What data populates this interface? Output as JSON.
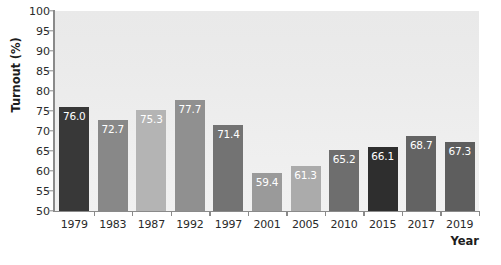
{
  "chart_data": {
    "type": "bar",
    "title": "",
    "xlabel": "Year",
    "ylabel": "Turnout (%)",
    "categories": [
      "1979",
      "1983",
      "1987",
      "1992",
      "1997",
      "2001",
      "2005",
      "2010",
      "2015",
      "2017",
      "2019"
    ],
    "values": [
      76.0,
      72.7,
      75.3,
      77.7,
      71.4,
      59.4,
      61.3,
      65.2,
      66.1,
      68.7,
      67.3
    ],
    "value_labels": [
      "76.0",
      "72.7",
      "75.3",
      "77.7",
      "71.4",
      "59.4",
      "61.3",
      "65.2",
      "66.1",
      "68.7",
      "67.3"
    ],
    "bar_colors": [
      "#383838",
      "#888888",
      "#b4b4b4",
      "#909090",
      "#737373",
      "#9a9a9a",
      "#ababab",
      "#6e6e6e",
      "#2e2e2e",
      "#636363",
      "#5e5e5e"
    ],
    "ylim": [
      50,
      100
    ],
    "yticks": [
      50,
      55,
      60,
      65,
      70,
      75,
      80,
      85,
      90,
      95,
      100
    ],
    "ytick_labels": [
      "50",
      "55",
      "60",
      "65",
      "70",
      "75",
      "80",
      "85",
      "90",
      "95",
      "100"
    ],
    "grid": false,
    "legend": null,
    "plot_background": "#ededed",
    "value_label_color": "#ffffff"
  },
  "caption": {
    "text": ""
  }
}
